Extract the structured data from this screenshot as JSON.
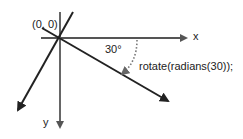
{
  "diagram": {
    "origin_label": "(0, 0)",
    "x_axis_label": "x",
    "y_axis_label": "y",
    "angle_label": "30°",
    "code_label": "rotate(radians(30));",
    "rotation_degrees": 30,
    "colors": {
      "original_axes": "#555555",
      "rotated_axes": "#222222",
      "arc": "#777777",
      "text": "#222222",
      "background": "#ffffff"
    }
  }
}
